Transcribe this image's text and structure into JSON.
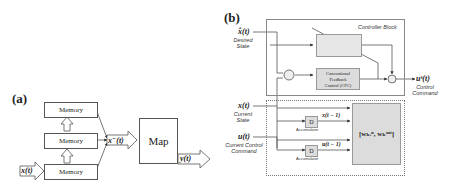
{
  "panel_a": {
    "label": "(a)",
    "memory_blocks": [
      "Memory",
      "Memory",
      "Memory"
    ],
    "input": "x(t)",
    "concat": "x⁻(t)",
    "map": "Map",
    "output": "y(t)"
  },
  "panel_b": {
    "label": "(b)",
    "inputs": {
      "desired": {
        "symbol": "x̂(t)",
        "caption_line1": "Desired",
        "caption_line2": "State"
      },
      "current_state": {
        "symbol": "x(t)",
        "caption_line1": "Current",
        "caption_line2": "State"
      },
      "current_control": {
        "symbol": "u(t)",
        "caption_line1": "Current Control",
        "caption_line2": "Command"
      }
    },
    "controller_block": {
      "title": "Controller Block",
      "cfc_line1": "Conventional",
      "cfc_line2": "Feedback",
      "cfc_line3": "Control (CFC)"
    },
    "output": {
      "symbol": "uˢ(t)",
      "caption_line1": "Control",
      "caption_line2": "Command"
    },
    "predictor_block": {
      "title": "Predictor Block",
      "delay_label": "D",
      "accumulator_label": "Accumulator",
      "x_delayed": "x(t − 1)",
      "u_delayed": "u(t − 1)",
      "weights": "[wₖᵢⁿ, wₖᵒᵘᵗ]"
    },
    "summing_signs": [
      "+",
      "−",
      "+",
      "+"
    ]
  },
  "colors": {
    "line": "#444444",
    "box_fill": "#dcdcdc",
    "box_border": "#999999"
  }
}
